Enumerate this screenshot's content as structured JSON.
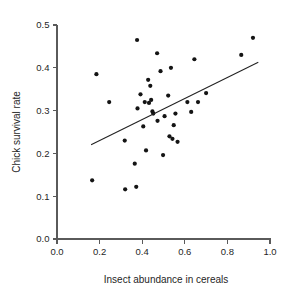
{
  "chart_data": {
    "type": "scatter",
    "title": "",
    "xlabel": "Insect abundance in cereals",
    "ylabel": "Chick survival rate",
    "xlim": [
      0.0,
      1.0
    ],
    "ylim": [
      0.0,
      0.5
    ],
    "grid": false,
    "legend": "none",
    "xticks": [
      "0.0",
      "0.2",
      "0.4",
      "0.6",
      "0.8",
      "1.0"
    ],
    "xtick_values": [
      0.0,
      0.2,
      0.4,
      0.6,
      0.8,
      1.0
    ],
    "yticks": [
      "0.0",
      "0.1",
      "0.2",
      "0.3",
      "0.4",
      "0.5"
    ],
    "ytick_values": [
      0.0,
      0.1,
      0.2,
      0.3,
      0.4,
      0.5
    ],
    "marker": "filled-circle",
    "marker_color": "#141414",
    "marker_size_px": 4.2,
    "points": [
      {
        "x": 0.165,
        "y": 0.137
      },
      {
        "x": 0.185,
        "y": 0.385
      },
      {
        "x": 0.245,
        "y": 0.32
      },
      {
        "x": 0.318,
        "y": 0.23
      },
      {
        "x": 0.32,
        "y": 0.116
      },
      {
        "x": 0.365,
        "y": 0.176
      },
      {
        "x": 0.372,
        "y": 0.122
      },
      {
        "x": 0.376,
        "y": 0.465
      },
      {
        "x": 0.378,
        "y": 0.305
      },
      {
        "x": 0.392,
        "y": 0.338
      },
      {
        "x": 0.405,
        "y": 0.263
      },
      {
        "x": 0.412,
        "y": 0.32
      },
      {
        "x": 0.418,
        "y": 0.207
      },
      {
        "x": 0.428,
        "y": 0.372
      },
      {
        "x": 0.432,
        "y": 0.318
      },
      {
        "x": 0.438,
        "y": 0.358
      },
      {
        "x": 0.442,
        "y": 0.325
      },
      {
        "x": 0.448,
        "y": 0.298
      },
      {
        "x": 0.452,
        "y": 0.293
      },
      {
        "x": 0.47,
        "y": 0.434
      },
      {
        "x": 0.472,
        "y": 0.276
      },
      {
        "x": 0.486,
        "y": 0.392
      },
      {
        "x": 0.498,
        "y": 0.196
      },
      {
        "x": 0.505,
        "y": 0.287
      },
      {
        "x": 0.522,
        "y": 0.335
      },
      {
        "x": 0.528,
        "y": 0.24
      },
      {
        "x": 0.535,
        "y": 0.4
      },
      {
        "x": 0.542,
        "y": 0.234
      },
      {
        "x": 0.548,
        "y": 0.266
      },
      {
        "x": 0.556,
        "y": 0.293
      },
      {
        "x": 0.566,
        "y": 0.227
      },
      {
        "x": 0.612,
        "y": 0.32
      },
      {
        "x": 0.63,
        "y": 0.297
      },
      {
        "x": 0.645,
        "y": 0.42
      },
      {
        "x": 0.662,
        "y": 0.32
      },
      {
        "x": 0.7,
        "y": 0.341
      },
      {
        "x": 0.865,
        "y": 0.43
      },
      {
        "x": 0.92,
        "y": 0.47
      }
    ],
    "trend_line": {
      "type": "linear-fit",
      "x_start": 0.16,
      "y_start": 0.22,
      "x_end": 0.945,
      "y_end": 0.413,
      "color": "#222222"
    }
  }
}
